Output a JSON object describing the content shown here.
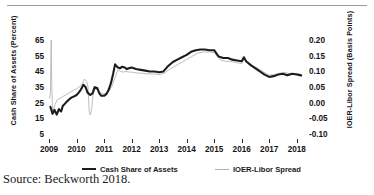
{
  "source_note": "Source: Beckworth 2018.",
  "legend": {
    "items": [
      {
        "label": "Cash Share of Assets",
        "style": "thick-black",
        "color": "#1c1c1c"
      },
      {
        "label": "IOER-Libor Spread",
        "style": "thin-gray",
        "color": "#b0b0b0"
      }
    ]
  },
  "chart_data": {
    "type": "line",
    "title": "",
    "xlabel": "",
    "grid": false,
    "legend_position": "bottom",
    "x_tick_labels": [
      "2009",
      "2010",
      "2011",
      "2012",
      "2013",
      "2014",
      "2015",
      "2016",
      "2017",
      "2018"
    ],
    "xlim": [
      2009,
      2018.3
    ],
    "axes": {
      "left": {
        "label": "Cash Share of Assets (Percent)",
        "ticks": [
          5,
          15,
          25,
          35,
          45,
          55,
          65
        ],
        "tick_labels": [
          "5",
          "15",
          "25",
          "35",
          "45",
          "55",
          "65"
        ],
        "lim": [
          0,
          70
        ]
      },
      "right": {
        "label": "IOER-Libor Spread (Basis Points)",
        "ticks": [
          -0.1,
          -0.05,
          0.0,
          0.05,
          0.1,
          0.15,
          0.2
        ],
        "tick_labels": [
          "-0.10",
          "-0.05",
          "0.00",
          "0.05",
          "0.10",
          "0.15",
          "0.20"
        ],
        "lim": [
          -0.125,
          0.225
        ]
      }
    },
    "series": [
      {
        "name": "Cash Share of Assets",
        "axis": "left",
        "color": "#1c1c1c",
        "width": 2.1,
        "x": [
          2009.05,
          2009.13,
          2009.2,
          2009.28,
          2009.36,
          2009.44,
          2009.5,
          2009.58,
          2009.66,
          2009.75,
          2009.83,
          2009.9,
          2010.0,
          2010.08,
          2010.16,
          2010.25,
          2010.33,
          2010.4,
          2010.5,
          2010.58,
          2010.66,
          2010.75,
          2010.83,
          2010.9,
          2011.0,
          2011.08,
          2011.16,
          2011.25,
          2011.33,
          2011.4,
          2011.5,
          2011.58,
          2011.66,
          2011.75,
          2011.83,
          2011.9,
          2012.0,
          2012.16,
          2012.33,
          2012.5,
          2012.66,
          2012.83,
          2013.0,
          2013.16,
          2013.33,
          2013.5,
          2013.66,
          2013.83,
          2014.0,
          2014.16,
          2014.33,
          2014.5,
          2014.66,
          2014.83,
          2015.0,
          2015.16,
          2015.33,
          2015.5,
          2015.66,
          2015.83,
          2016.0,
          2016.08,
          2016.16,
          2016.33,
          2016.5,
          2016.66,
          2016.83,
          2017.0,
          2017.16,
          2017.33,
          2017.5,
          2017.66,
          2017.83,
          2018.0,
          2018.16
        ],
        "y": [
          20.5,
          16.0,
          18.5,
          15.5,
          19.0,
          17.5,
          21.0,
          22.5,
          24.0,
          25.5,
          26.5,
          27.0,
          28.0,
          29.5,
          31.5,
          34.5,
          33.0,
          29.5,
          28.0,
          29.0,
          33.0,
          32.5,
          29.0,
          27.5,
          27.5,
          28.5,
          31.0,
          35.5,
          41.5,
          47.5,
          45.5,
          45.0,
          46.0,
          45.5,
          44.5,
          45.0,
          45.5,
          44.5,
          44.0,
          43.5,
          43.0,
          43.0,
          42.5,
          43.0,
          46.5,
          49.0,
          50.5,
          52.0,
          53.5,
          55.5,
          56.5,
          57.0,
          57.0,
          56.5,
          56.5,
          52.5,
          51.5,
          51.5,
          50.5,
          50.0,
          49.5,
          52.0,
          49.5,
          47.0,
          45.0,
          43.0,
          41.0,
          39.5,
          40.0,
          41.0,
          41.5,
          40.5,
          41.5,
          41.0,
          40.5
        ]
      },
      {
        "name": "IOER-Libor Spread",
        "axis": "right",
        "color": "#b5b5b5",
        "width": 0.9,
        "x": [
          2009.02,
          2009.05,
          2009.08,
          2009.1,
          2009.13,
          2009.17,
          2009.22,
          2009.3,
          2009.4,
          2009.5,
          2009.6,
          2009.7,
          2009.8,
          2009.9,
          2010.0,
          2010.1,
          2010.2,
          2010.28,
          2010.36,
          2010.42,
          2010.46,
          2010.5,
          2010.55,
          2010.6,
          2010.66,
          2010.75,
          2010.83,
          2010.92,
          2011.0,
          2011.1,
          2011.2,
          2011.3,
          2011.4,
          2011.5,
          2011.6,
          2011.7,
          2011.8,
          2011.9,
          2012.0,
          2012.2,
          2012.4,
          2012.6,
          2012.8,
          2013.0,
          2013.2,
          2013.4,
          2013.6,
          2013.8,
          2014.0,
          2014.2,
          2014.4,
          2014.6,
          2014.8,
          2015.0,
          2015.2,
          2015.4,
          2015.6,
          2015.8,
          2016.0,
          2016.1,
          2016.2,
          2016.4,
          2016.6,
          2016.8,
          2017.0,
          2017.2,
          2017.4,
          2017.6,
          2017.8,
          2018.0,
          2018.16
        ],
        "y": [
          0.005,
          0.02,
          0.19,
          0.05,
          -0.045,
          -0.03,
          -0.015,
          0.0,
          0.005,
          0.01,
          0.015,
          0.02,
          0.025,
          0.03,
          0.035,
          0.04,
          0.05,
          0.065,
          0.06,
          0.04,
          -0.04,
          -0.048,
          -0.03,
          0.015,
          0.035,
          0.032,
          0.025,
          0.02,
          0.018,
          0.022,
          0.03,
          0.045,
          0.07,
          0.095,
          0.09,
          0.088,
          0.09,
          0.088,
          0.088,
          0.085,
          0.084,
          0.082,
          0.082,
          0.08,
          0.085,
          0.098,
          0.108,
          0.118,
          0.128,
          0.138,
          0.148,
          0.152,
          0.152,
          0.15,
          0.128,
          0.122,
          0.122,
          0.118,
          0.115,
          0.13,
          0.118,
          0.108,
          0.1,
          0.088,
          0.078,
          0.08,
          0.085,
          0.086,
          0.082,
          0.084,
          0.08
        ]
      }
    ]
  }
}
